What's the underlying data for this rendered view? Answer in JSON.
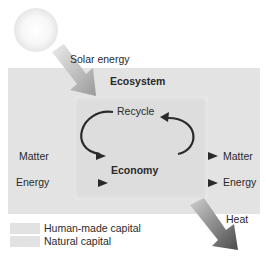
{
  "diagram": {
    "type": "flow-diagram",
    "inputs_label": "Solar energy",
    "outer_box_label": "Ecosystem",
    "inner_box_label": "Economy",
    "recycle_label": "Recycle",
    "left_inputs": [
      "Matter",
      "Energy"
    ],
    "right_outputs": [
      "Matter",
      "Energy"
    ],
    "output_label": "Heat"
  },
  "legend": {
    "items": [
      {
        "label": "Human-made capital",
        "color": "#e2e2e2"
      },
      {
        "label": "Natural capital",
        "color": "#e2e2e2"
      }
    ]
  },
  "colors": {
    "natural_capital": "#e3e3e3",
    "human_made_capital": "#dddddd",
    "arrow": "#2a2a2a"
  }
}
